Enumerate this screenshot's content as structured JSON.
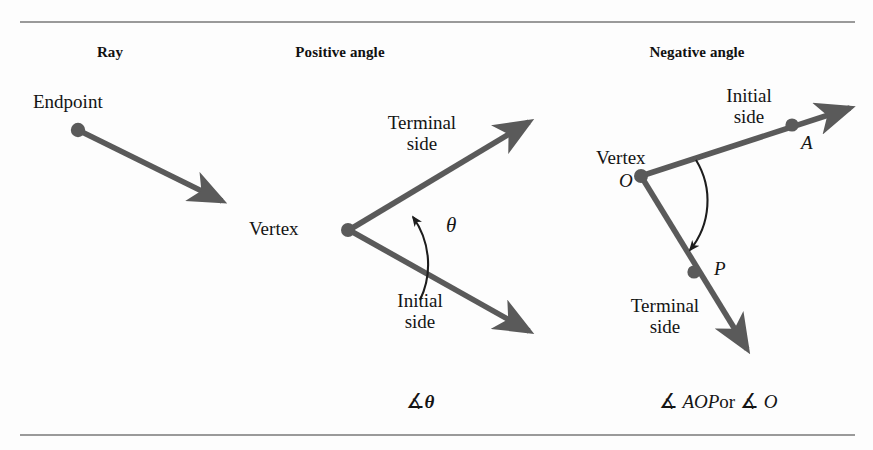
{
  "figure": {
    "panels": [
      {
        "id": "ray",
        "title": "Ray",
        "labels": {
          "endpoint": "Endpoint"
        }
      },
      {
        "id": "positive-angle",
        "title": "Positive angle",
        "labels": {
          "vertex": "Vertex",
          "terminal_side_line1": "Terminal",
          "terminal_side_line2": "side",
          "initial_side_line1": "Initial",
          "initial_side_line2": "side",
          "angle_variable": "θ"
        },
        "notation": {
          "symbol": "∡",
          "name": "θ"
        }
      },
      {
        "id": "negative-angle",
        "title": "Negative angle",
        "labels": {
          "vertex": "Vertex",
          "vertex_point": "O",
          "initial_side_line1": "Initial",
          "initial_side_line2": "side",
          "terminal_side_line1": "Terminal",
          "terminal_side_line2": "side",
          "point_a": "A",
          "point_p": "P"
        },
        "notation": {
          "symbol_1": "∡",
          "name_1": "AOP",
          "conjunction": "or",
          "symbol_2": "∡",
          "name_2": "O"
        }
      }
    ],
    "colors": {
      "stroke": "#5a5a5a",
      "rule": "#9a9a9a",
      "text": "#141414",
      "background": "#fdfdfd"
    }
  }
}
